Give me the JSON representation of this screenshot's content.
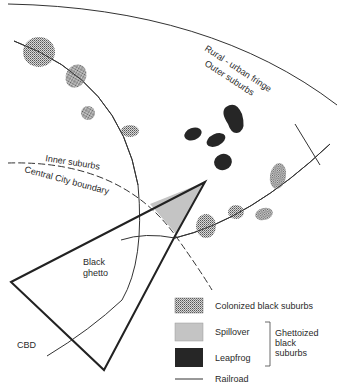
{
  "diagram": {
    "type": "urban model map",
    "labels": {
      "rural_urban_fringe": "Rural - urban fringe",
      "outer_suburbs": "Outer suburbs",
      "inner_suburbs": "Inner suburbs",
      "central_city_boundary": "Central City boundary",
      "black_ghetto_line1": "Black",
      "black_ghetto_line2": "ghetto",
      "cbd": "CBD"
    },
    "colors": {
      "line": "#2a2a2a",
      "colonized": "#9a9a9a",
      "spillover": "#c4c4c4",
      "leapfrog": "#262626"
    }
  },
  "legend": {
    "items": [
      {
        "key": "colonized",
        "label": "Colonized black suburbs"
      },
      {
        "key": "spillover",
        "label": "Spillover"
      },
      {
        "key": "leapfrog",
        "label": "Leapfrog"
      },
      {
        "key": "railroad",
        "label": "Railroad"
      }
    ],
    "group_label_line1": "Ghettoized",
    "group_label_line2": "black",
    "group_label_line3": "suburbs"
  }
}
